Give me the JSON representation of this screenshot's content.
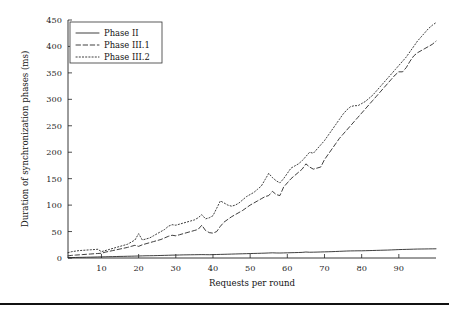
{
  "chart_data": {
    "type": "line",
    "title": "",
    "xlabel": "Requests per round",
    "ylabel": "Duration of synchronization phases (ms)",
    "xlim": [
      1,
      100
    ],
    "ylim": [
      0,
      450
    ],
    "xticks": [
      10,
      20,
      30,
      40,
      50,
      60,
      70,
      80,
      90
    ],
    "yticks": [
      0,
      50,
      100,
      150,
      200,
      250,
      300,
      350,
      400,
      450
    ],
    "grid": false,
    "legend_position": "top-left",
    "x": [
      1,
      2,
      3,
      4,
      5,
      6,
      7,
      8,
      9,
      10,
      11,
      12,
      13,
      14,
      15,
      16,
      17,
      18,
      19,
      20,
      21,
      22,
      23,
      24,
      25,
      26,
      27,
      28,
      29,
      30,
      31,
      32,
      33,
      34,
      35,
      36,
      37,
      38,
      39,
      40,
      41,
      42,
      43,
      44,
      45,
      46,
      47,
      48,
      49,
      50,
      51,
      52,
      53,
      54,
      55,
      56,
      57,
      58,
      59,
      60,
      61,
      62,
      63,
      64,
      65,
      66,
      67,
      68,
      69,
      70,
      71,
      72,
      73,
      74,
      75,
      76,
      77,
      78,
      79,
      80,
      81,
      82,
      83,
      84,
      85,
      86,
      87,
      88,
      89,
      90,
      91,
      92,
      93,
      94,
      95,
      96,
      97,
      98,
      99,
      100
    ],
    "series": [
      {
        "name": "Phase II",
        "style": "solid",
        "values": [
          0.5,
          0.8,
          1.0,
          1.2,
          1.3,
          1.5,
          1.6,
          1.8,
          2.0,
          2.1,
          2.3,
          2.5,
          2.6,
          2.8,
          3.0,
          3.1,
          3.3,
          3.4,
          3.6,
          3.8,
          4.0,
          4.2,
          4.3,
          4.4,
          4.6,
          4.8,
          5.0,
          5.2,
          5.4,
          5.5,
          5.7,
          5.9,
          6.0,
          6.1,
          6.2,
          6.3,
          6.4,
          6.3,
          6.2,
          6.4,
          6.6,
          6.8,
          7.0,
          7.2,
          7.4,
          7.6,
          7.8,
          8.0,
          8.2,
          8.4,
          8.6,
          8.8,
          9.0,
          9.2,
          9.5,
          9.8,
          9.5,
          9.4,
          9.6,
          9.8,
          10.0,
          10.2,
          10.4,
          10.6,
          11.3,
          10.9,
          11.0,
          11.2,
          11.4,
          11.6,
          11.8,
          12.0,
          12.3,
          12.6,
          12.9,
          13.2,
          13.4,
          13.5,
          13.6,
          13.6,
          13.8,
          14.0,
          14.2,
          14.4,
          14.6,
          14.8,
          15.0,
          15.3,
          15.6,
          15.9,
          16.1,
          16.3,
          16.5,
          16.7,
          16.9,
          17.0,
          17.1,
          17.2,
          17.3,
          17.4
        ]
      },
      {
        "name": "Phase III.1",
        "style": "dashed",
        "values": [
          4.0,
          5.0,
          5.5,
          6.0,
          6.5,
          7.0,
          7.5,
          8.0,
          8.5,
          9.0,
          11.0,
          12.5,
          14.0,
          15.5,
          17.0,
          18.5,
          20.0,
          22.0,
          24.0,
          22.0,
          25.0,
          27.0,
          29.0,
          31.0,
          33.0,
          35.0,
          38.0,
          41.0,
          43.0,
          42.0,
          44.0,
          46.0,
          48.0,
          50.0,
          52.0,
          54.0,
          62.0,
          52.0,
          48.0,
          47.0,
          50.0,
          60.0,
          68.0,
          73.0,
          78.0,
          82.0,
          86.0,
          90.0,
          95.0,
          100.0,
          104.0,
          108.0,
          112.0,
          116.0,
          118.0,
          126.0,
          120.0,
          118.0,
          134.0,
          142.0,
          150.0,
          156.0,
          162.0,
          168.0,
          178.0,
          172.0,
          168.0,
          170.0,
          172.0,
          186.0,
          196.0,
          206.0,
          216.0,
          226.0,
          234.0,
          242.0,
          250.0,
          258.0,
          266.0,
          274.0,
          282.0,
          290.0,
          298.0,
          306.0,
          314.0,
          322.0,
          330.0,
          338.0,
          346.0,
          352.0,
          352.0,
          360.0,
          372.0,
          382.0,
          388.0,
          392.0,
          396.0,
          400.0,
          404.0,
          410.0
        ]
      },
      {
        "name": "Phase III.2",
        "style": "dotted",
        "values": [
          10.0,
          12.0,
          13.0,
          14.0,
          14.5,
          15.0,
          15.5,
          16.0,
          16.5,
          12.0,
          14.0,
          16.0,
          18.0,
          20.0,
          22.0,
          24.0,
          26.0,
          30.0,
          34.0,
          46.0,
          34.0,
          36.0,
          38.0,
          42.0,
          46.0,
          50.0,
          54.0,
          60.0,
          63.0,
          62.0,
          64.0,
          66.0,
          68.0,
          70.0,
          72.0,
          76.0,
          82.0,
          74.0,
          76.0,
          80.0,
          94.0,
          108.0,
          104.0,
          100.0,
          98.0,
          100.0,
          104.0,
          110.0,
          116.0,
          120.0,
          124.0,
          130.0,
          136.0,
          148.0,
          160.0,
          152.0,
          146.0,
          142.0,
          150.0,
          160.0,
          170.0,
          174.0,
          178.0,
          184.0,
          192.0,
          200.0,
          198.0,
          206.0,
          214.0,
          222.0,
          232.0,
          242.0,
          252.0,
          262.0,
          272.0,
          280.0,
          286.0,
          288.0,
          288.0,
          292.0,
          296.0,
          302.0,
          308.0,
          316.0,
          324.0,
          332.0,
          340.0,
          348.0,
          356.0,
          364.0,
          372.0,
          380.0,
          390.0,
          400.0,
          410.0,
          418.0,
          426.0,
          434.0,
          440.0,
          445.0
        ]
      }
    ]
  },
  "legend": {
    "items": [
      {
        "label": "Phase II",
        "style": "solid"
      },
      {
        "label": "Phase III.1",
        "style": "dashed"
      },
      {
        "label": "Phase III.2",
        "style": "dotted"
      }
    ]
  },
  "colors": {
    "ink": "#1c1c1c",
    "background": "#ffffff",
    "rule": "#111111"
  }
}
